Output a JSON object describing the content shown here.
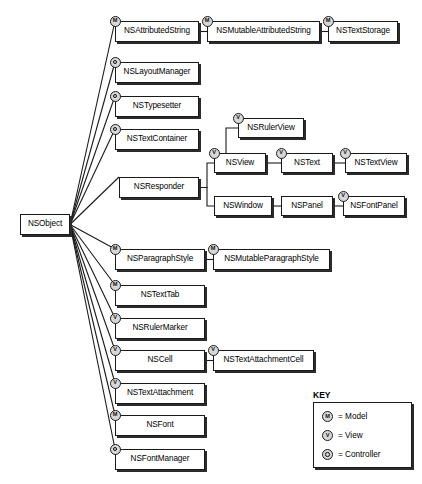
{
  "diagram": {
    "root": "NSObject",
    "stereotypes": {
      "model": "M",
      "view": "V",
      "controller": "C"
    },
    "nodes": [
      {
        "id": "nsobject",
        "label": "NSObject",
        "badge": "none",
        "x": 20,
        "y": 214,
        "w": 50,
        "h": 21
      },
      {
        "id": "nsattributedstring",
        "label": "NSAttributedString",
        "badge": "model",
        "x": 115,
        "y": 21,
        "w": 84,
        "h": 21
      },
      {
        "id": "nsmutableattributedstring",
        "label": "NSMutableAttributedString",
        "badge": "model",
        "x": 207,
        "y": 21,
        "w": 113,
        "h": 21
      },
      {
        "id": "nstextstorage",
        "label": "NSTextStorage",
        "badge": "model",
        "x": 328,
        "y": 21,
        "w": 70,
        "h": 21
      },
      {
        "id": "nslayoutmanager",
        "label": "NSLayoutManager",
        "badge": "controller",
        "x": 115,
        "y": 62,
        "w": 84,
        "h": 21
      },
      {
        "id": "nstypesetter",
        "label": "NSTypesetter",
        "badge": "controller",
        "x": 115,
        "y": 96,
        "w": 84,
        "h": 21
      },
      {
        "id": "nstextcontainer",
        "label": "NSTextContainer",
        "badge": "controller",
        "x": 115,
        "y": 129,
        "w": 84,
        "h": 21
      },
      {
        "id": "nsresponder",
        "label": "NSResponder",
        "badge": "none",
        "x": 119,
        "y": 177,
        "w": 80,
        "h": 21
      },
      {
        "id": "nsrulerview",
        "label": "NSRulerView",
        "badge": "view",
        "x": 238,
        "y": 118,
        "w": 66,
        "h": 20
      },
      {
        "id": "nsview",
        "label": "NSView",
        "badge": "view",
        "x": 214,
        "y": 153,
        "w": 52,
        "h": 20
      },
      {
        "id": "nstext",
        "label": "NSText",
        "badge": "view",
        "x": 281,
        "y": 153,
        "w": 52,
        "h": 20
      },
      {
        "id": "nstextview",
        "label": "NSTextView",
        "badge": "view",
        "x": 345,
        "y": 153,
        "w": 62,
        "h": 20
      },
      {
        "id": "nswindow",
        "label": "NSWindow",
        "badge": "none",
        "x": 214,
        "y": 196,
        "w": 58,
        "h": 20
      },
      {
        "id": "nspanel",
        "label": "NSPanel",
        "badge": "none",
        "x": 281,
        "y": 196,
        "w": 52,
        "h": 20
      },
      {
        "id": "nsfontpanel",
        "label": "NSFontPanel",
        "badge": "view",
        "x": 343,
        "y": 196,
        "w": 62,
        "h": 20
      },
      {
        "id": "nsparagraphstyle",
        "label": "NSParagraphStyle",
        "badge": "model",
        "x": 115,
        "y": 249,
        "w": 90,
        "h": 21
      },
      {
        "id": "nsmutableparagraphstyle",
        "label": "NSMutableParagraphStyle",
        "badge": "model",
        "x": 213,
        "y": 249,
        "w": 117,
        "h": 21
      },
      {
        "id": "nstexttab",
        "label": "NSTextTab",
        "badge": "model",
        "x": 115,
        "y": 285,
        "w": 90,
        "h": 21
      },
      {
        "id": "nsrulermarker",
        "label": "NSRulerMarker",
        "badge": "view",
        "x": 115,
        "y": 318,
        "w": 90,
        "h": 21
      },
      {
        "id": "nscell",
        "label": "NSCell",
        "badge": "view",
        "x": 115,
        "y": 350,
        "w": 90,
        "h": 21
      },
      {
        "id": "nstextattachmentcell",
        "label": "NSTextAttachmentCell",
        "badge": "view",
        "x": 213,
        "y": 350,
        "w": 101,
        "h": 21
      },
      {
        "id": "nstextattachment",
        "label": "NSTextAttachment",
        "badge": "view",
        "x": 115,
        "y": 383,
        "w": 90,
        "h": 21
      },
      {
        "id": "nsfont",
        "label": "NSFont",
        "badge": "model",
        "x": 115,
        "y": 415,
        "w": 90,
        "h": 21
      },
      {
        "id": "nsfontmanager",
        "label": "NSFontManager",
        "badge": "controller",
        "x": 115,
        "y": 449,
        "w": 90,
        "h": 21
      }
    ],
    "edges": [
      {
        "from": "nsobject",
        "to": "nsattributedstring"
      },
      {
        "from": "nsobject",
        "to": "nslayoutmanager"
      },
      {
        "from": "nsobject",
        "to": "nstypesetter"
      },
      {
        "from": "nsobject",
        "to": "nstextcontainer"
      },
      {
        "from": "nsobject",
        "to": "nsresponder"
      },
      {
        "from": "nsobject",
        "to": "nsparagraphstyle"
      },
      {
        "from": "nsobject",
        "to": "nstexttab"
      },
      {
        "from": "nsobject",
        "to": "nsrulermarker"
      },
      {
        "from": "nsobject",
        "to": "nscell"
      },
      {
        "from": "nsobject",
        "to": "nstextattachment"
      },
      {
        "from": "nsobject",
        "to": "nsfont"
      },
      {
        "from": "nsobject",
        "to": "nsfontmanager"
      },
      {
        "from": "nsattributedstring",
        "to": "nsmutableattributedstring"
      },
      {
        "from": "nsmutableattributedstring",
        "to": "nstextstorage"
      },
      {
        "from": "nsresponder",
        "to": "nsview"
      },
      {
        "from": "nsresponder",
        "to": "nswindow"
      },
      {
        "from": "nsview",
        "to": "nsrulerview"
      },
      {
        "from": "nsview",
        "to": "nstext"
      },
      {
        "from": "nstext",
        "to": "nstextview"
      },
      {
        "from": "nswindow",
        "to": "nspanel"
      },
      {
        "from": "nspanel",
        "to": "nsfontpanel"
      },
      {
        "from": "nsparagraphstyle",
        "to": "nsmutableparagraphstyle"
      },
      {
        "from": "nscell",
        "to": "nstextattachmentcell"
      }
    ]
  },
  "key": {
    "title": "KEY",
    "rows": [
      {
        "badge": "model",
        "glyph": "M",
        "label": "= Model"
      },
      {
        "badge": "view",
        "glyph": "V",
        "label": "= View"
      },
      {
        "badge": "controller",
        "glyph": "C",
        "label": "= Controller"
      }
    ]
  },
  "colors": {
    "stroke": "#1a1a1a",
    "shadow": "#2b2b2b",
    "badge_fill": "#d7d7d7",
    "background": "#ffffff"
  }
}
